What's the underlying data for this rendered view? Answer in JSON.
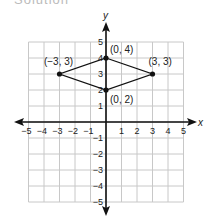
{
  "heading": "Solution",
  "chart_data": {
    "type": "scatter",
    "title": "",
    "xlabel": "x",
    "ylabel": "y",
    "xlim": [
      -5,
      5
    ],
    "ylim": [
      -5,
      5
    ],
    "grid": true,
    "x_ticks": [
      "−5",
      "−4",
      "−3",
      "−2",
      "−1",
      "1",
      "2",
      "3",
      "4",
      "5"
    ],
    "y_ticks": [
      "5",
      "4",
      "3",
      "2",
      "1",
      "−1",
      "−2",
      "−3",
      "−4",
      "−5"
    ],
    "points": [
      {
        "x": 0,
        "y": 4,
        "label": "(0, 4)"
      },
      {
        "x": 3,
        "y": 3,
        "label": "(3, 3)"
      },
      {
        "x": 0,
        "y": 2,
        "label": "(0, 2)"
      },
      {
        "x": -3,
        "y": 3,
        "label": "(−3, 3)"
      }
    ],
    "polygon": "kite connecting (0,4), (3,3), (0,2), (-3,3)"
  },
  "colors": {
    "grid": "#c8c8c8",
    "axis": "#111111",
    "shape": "#111111"
  }
}
